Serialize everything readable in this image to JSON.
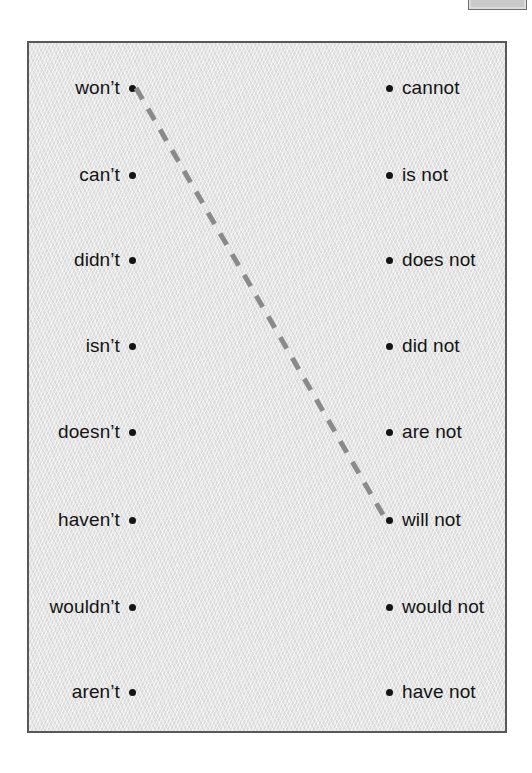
{
  "panel": {
    "background_color": "#e2e2e2",
    "border_color": "#58585a"
  },
  "corner_box": {
    "name": "cropped-box-top-right",
    "fill_color": "#dcdcdc",
    "border_color": "#6e6e6e"
  },
  "columns": {
    "left": {
      "items": [
        {
          "label": "won’t"
        },
        {
          "label": "can’t"
        },
        {
          "label": "didn’t"
        },
        {
          "label": "isn’t"
        },
        {
          "label": "doesn’t"
        },
        {
          "label": "haven’t"
        },
        {
          "label": "wouldn’t"
        },
        {
          "label": "aren’t"
        }
      ]
    },
    "right": {
      "items": [
        {
          "label": "cannot"
        },
        {
          "label": "is not"
        },
        {
          "label": "does not"
        },
        {
          "label": "did not"
        },
        {
          "label": "are not"
        },
        {
          "label": "will not"
        },
        {
          "label": "would not"
        },
        {
          "label": "have not"
        }
      ]
    }
  },
  "connections": [
    {
      "from": "won’t",
      "to": "will not",
      "from_index": 0,
      "to_index": 5,
      "style": "dashed",
      "color": "#8a8a8a"
    }
  ]
}
